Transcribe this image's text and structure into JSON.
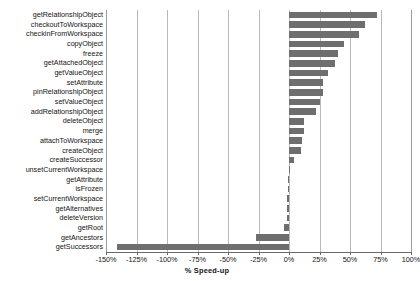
{
  "chart_data": {
    "type": "bar",
    "orientation": "horizontal",
    "title": "",
    "xlabel": "% Speed-up",
    "ylabel": "",
    "xlim": [
      -150,
      100
    ],
    "ylim": null,
    "grid": true,
    "legend": null,
    "xticks": [
      -150,
      -125,
      -100,
      -75,
      -50,
      -25,
      0,
      25,
      50,
      75,
      100
    ],
    "xticklabels": [
      "-150%",
      "-125%",
      "-100%",
      "-75%",
      "-50%",
      "-25%",
      "0%",
      "25%",
      "50%",
      "75%",
      "100%"
    ],
    "bar_color": "#6e6e6e",
    "categories": [
      "getRelationshipObject",
      "checkoutToWorkspace",
      "checkinFromWorkspace",
      "copyObject",
      "freeze",
      "getAttachedObject",
      "getValueObject",
      "setAttribute",
      "pinRelationshipObject",
      "setValueObject",
      "addRelationshipObject",
      "deleteObject",
      "merge",
      "attachToWorkspace",
      "createObject",
      "createSuccessor",
      "unsetCurrentWorkspace",
      "getAttribute",
      "isFrozen",
      "setCurrentWorkspace",
      "getAlternatives",
      "deleteVersion",
      "getRoot",
      "getAncestors",
      "getSuccessors"
    ],
    "values": [
      72,
      62,
      57,
      45,
      40,
      38,
      32,
      28,
      28,
      25,
      22,
      12,
      12,
      11,
      10,
      4,
      1,
      -1,
      -1,
      -2,
      -2,
      -2,
      -4,
      -27,
      -141
    ]
  }
}
